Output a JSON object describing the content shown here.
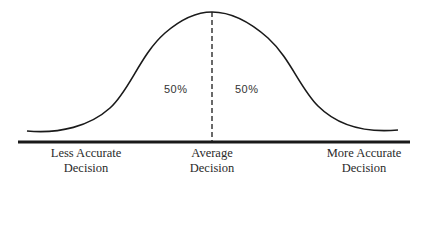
{
  "diagram": {
    "type": "normal-distribution-curve",
    "colors": {
      "curve": "#1a1a1a",
      "axis": "#1a1a1a",
      "divider": "#1a1a1a",
      "text": "#2a2a2a"
    },
    "regions": [
      {
        "label": "50%"
      },
      {
        "label": "50%"
      }
    ],
    "axis_labels": [
      {
        "line1": "Less Accurate",
        "line2": "Decision"
      },
      {
        "line1": "Average",
        "line2": "Decision"
      },
      {
        "line1": "More Accurate",
        "line2": "Decision"
      }
    ]
  }
}
